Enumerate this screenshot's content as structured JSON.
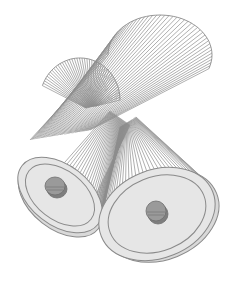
{
  "canvas": {
    "width": 229,
    "height": 284,
    "background": "#ffffff"
  },
  "colors": {
    "string": "#8c8c8c",
    "disc_fill": "#e6e6e6",
    "disc_rim": "#d9d9d9",
    "disc_edge": "#8a8a8a",
    "knob_fill": "#9a9a9a",
    "knob_dark": "#7e7e7e",
    "knob_edge": "#6f6f6f"
  },
  "upper_fan": {
    "description": "twisted string surface, upper loops",
    "left_loop": {
      "cx": 80,
      "cy": 100,
      "rx": 40,
      "ry": 42,
      "start": 200,
      "end": 360
    },
    "right_loop": {
      "cx": 160,
      "cy": 55,
      "rx": 52,
      "ry": 40,
      "start": 180,
      "end": 380
    },
    "line_count": 44
  },
  "lower_left_disc": {
    "cx": 60,
    "cy": 195,
    "rx": 48,
    "ry": 30,
    "rotation": 38,
    "inner_scale": 0.82,
    "knob": {
      "cx": 55,
      "cy": 186,
      "rx": 10,
      "ry": 9
    }
  },
  "lower_right_disc": {
    "cx": 157,
    "cy": 214,
    "rx": 60,
    "ry": 44,
    "rotation": -22,
    "inner_scale": 0.84,
    "knob": {
      "cx": 156,
      "cy": 211,
      "rx": 10,
      "ry": 10
    }
  },
  "strings": {
    "left_bundle": {
      "from": {
        "x": 40,
        "y": 150
      },
      "to_center": {
        "x": 125,
        "y": 120
      },
      "count": 40
    },
    "right_bundle": {
      "from_center": {
        "x": 130,
        "y": 125
      },
      "to": {
        "x": 157,
        "y": 170
      },
      "count": 40
    }
  }
}
